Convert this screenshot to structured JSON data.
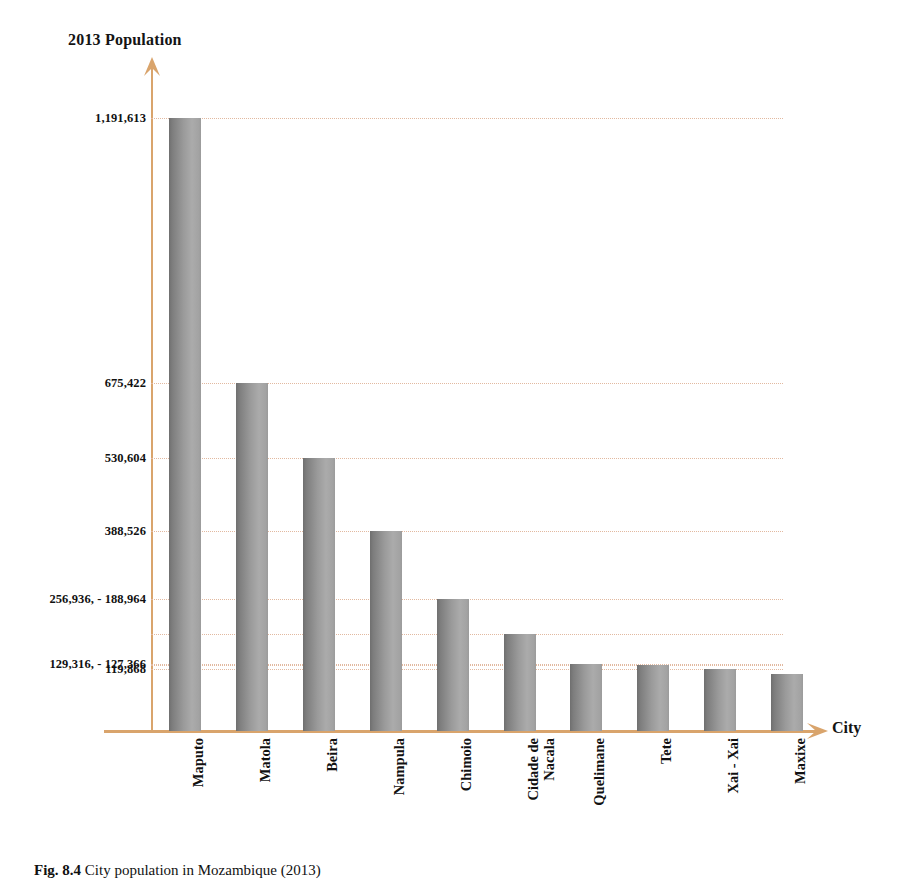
{
  "figure": {
    "caption_number": "Fig. 8.4",
    "caption_text": "City population in Mozambique (2013)"
  },
  "axis": {
    "y_title": "2013 Population",
    "x_title": "City",
    "y_arrow_icon": "arrow-up-icon",
    "x_arrow_icon": "arrow-right-icon",
    "axis_color": "#d9a46c",
    "gridline_color": "#e2b9a0"
  },
  "chart_data": {
    "type": "bar",
    "title": "City population in Mozambique (2013)",
    "xlabel": "City",
    "ylabel": "2013 Population",
    "grid": true,
    "legend": false,
    "bar_color": "#9a9a9a",
    "categories": [
      "Maputo",
      "Matola",
      "Beira",
      "Nampula",
      "Chimoio",
      "Cidade de\nNacala",
      "Quelimane",
      "Tete",
      "Xai - Xai",
      "Maxixe"
    ],
    "values": [
      1191613,
      675422,
      530604,
      388526,
      256936,
      188964,
      129316,
      127366,
      119868,
      110000
    ],
    "ylim": [
      0,
      1300000
    ],
    "ytick_labels": [
      "1,191,613",
      "675,422",
      "530,604",
      "388,526",
      "256,936, - 188,964",
      "129,316, - 127,366",
      "119,868"
    ],
    "ytick_values": [
      1191613,
      675422,
      530604,
      388526,
      256936,
      129316,
      119868
    ]
  }
}
